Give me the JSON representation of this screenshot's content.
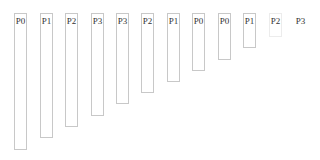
{
  "bars": [
    {
      "label": "P0",
      "x": 14,
      "bottom": 150,
      "style": ""
    },
    {
      "label": "P1",
      "x": 40,
      "bottom": 138,
      "style": ""
    },
    {
      "label": "P2",
      "x": 65,
      "bottom": 127,
      "style": ""
    },
    {
      "label": "P3",
      "x": 91,
      "bottom": 116,
      "style": ""
    },
    {
      "label": "P3",
      "x": 116,
      "bottom": 104,
      "style": ""
    },
    {
      "label": "P2",
      "x": 141,
      "bottom": 93,
      "style": ""
    },
    {
      "label": "P1",
      "x": 167,
      "bottom": 82,
      "style": ""
    },
    {
      "label": "P0",
      "x": 192,
      "bottom": 71,
      "style": ""
    },
    {
      "label": "P0",
      "x": 218,
      "bottom": 60,
      "style": ""
    },
    {
      "label": "P1",
      "x": 243,
      "bottom": 48,
      "style": ""
    },
    {
      "label": "P2",
      "x": 269,
      "bottom": 37,
      "style": "faint"
    },
    {
      "label": "P3",
      "x": 294,
      "bottom": 27,
      "style": "none"
    }
  ]
}
